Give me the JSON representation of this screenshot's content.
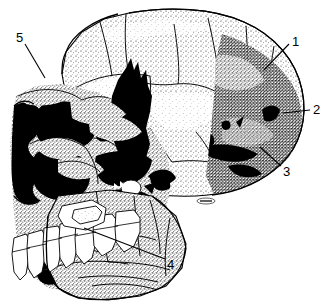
{
  "figure": {
    "kind": "scientific-line-illustration",
    "background_color": "#ffffff",
    "ink_color": "#000000",
    "width": 331,
    "height": 308,
    "artist_mark": "~"
  },
  "callouts": [
    {
      "id": "1",
      "label": "1",
      "label_x": 292,
      "label_y": 35,
      "line_from_x": 289,
      "line_from_y": 44,
      "line_to_x": 264,
      "line_to_y": 70
    },
    {
      "id": "2",
      "label": "2",
      "label_x": 313,
      "label_y": 103,
      "line_from_x": 310,
      "line_from_y": 110,
      "line_to_x": 283,
      "line_to_y": 113
    },
    {
      "id": "3",
      "label": "3",
      "label_x": 283,
      "label_y": 165,
      "line_from_x": 281,
      "line_from_y": 166,
      "line_to_x": 260,
      "line_to_y": 147
    },
    {
      "id": "4",
      "label": "4",
      "label_x": 167,
      "label_y": 258,
      "line_from_x": 165,
      "line_from_y": 259,
      "line_to_x": 84,
      "line_to_y": 228
    },
    {
      "id": "5",
      "label": "5",
      "label_x": 16,
      "label_y": 31,
      "line_from_x": 25,
      "line_from_y": 44,
      "line_to_x": 45,
      "line_to_y": 78
    }
  ],
  "regions": [
    {
      "name": "cranial-vault",
      "shading": "light-stipple"
    },
    {
      "name": "occipital-region",
      "shading": "dark-stipple"
    },
    {
      "name": "temporal-void",
      "shading": "solid-black"
    },
    {
      "name": "orbit-void",
      "shading": "solid-black"
    },
    {
      "name": "nasal-aperture-void",
      "shading": "solid-black"
    },
    {
      "name": "maxilla",
      "shading": "medium-stipple"
    },
    {
      "name": "mandible",
      "shading": "medium-stipple"
    },
    {
      "name": "teeth-row",
      "shading": "white-outline"
    }
  ]
}
